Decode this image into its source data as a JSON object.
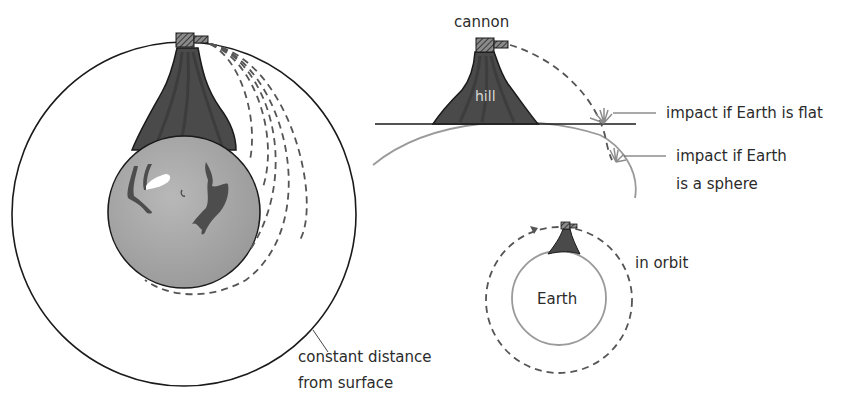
{
  "diagram": {
    "left_panel": {
      "labels": {
        "constant_distance_line1": "constant distance",
        "constant_distance_line2": "from surface"
      }
    },
    "top_right_panel": {
      "labels": {
        "cannon": "cannon",
        "hill": "hill",
        "impact_flat": "impact if Earth is flat",
        "impact_sphere_line1": "impact if Earth",
        "impact_sphere_line2": "is a sphere"
      }
    },
    "bottom_right_panel": {
      "labels": {
        "earth": "Earth",
        "in_orbit": "in orbit"
      }
    },
    "colors": {
      "outline": "#1a1a1a",
      "hill_fill": "#4a4a4a",
      "hill_streak": "#333333",
      "earth_fill": "#a8a8a8",
      "earth_continent": "#4d4d4d",
      "trajectory": "#555555",
      "sphere_curve": "#9a9a9a",
      "impact_burst": "#8c8c8c",
      "text": "#2b2b2b"
    }
  }
}
